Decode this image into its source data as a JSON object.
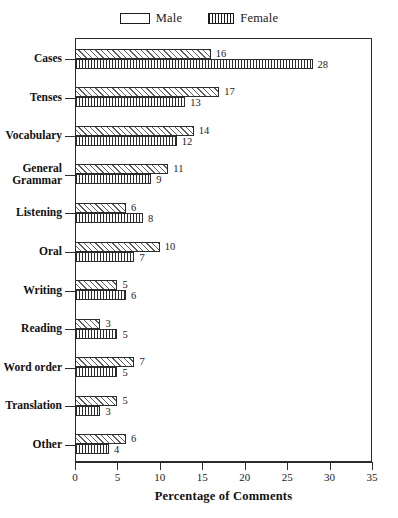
{
  "chart_data": {
    "type": "bar",
    "orientation": "horizontal",
    "title": "",
    "xlabel": "Percentage of Comments",
    "ylabel": "",
    "xlim": [
      0,
      35
    ],
    "xticks": [
      0,
      5,
      10,
      15,
      20,
      25,
      30,
      35
    ],
    "grid": false,
    "legend_position": "top-center",
    "categories": [
      "Cases",
      "Tenses",
      "Vocabulary",
      "General\nGrammar",
      "Listening",
      "Oral",
      "Writing",
      "Reading",
      "Word order",
      "Translation",
      "Other"
    ],
    "series": [
      {
        "name": "Male",
        "pattern": "diagonal-hatch",
        "values": [
          16,
          17,
          14,
          11,
          6,
          10,
          5,
          3,
          7,
          5,
          6
        ]
      },
      {
        "name": "Female",
        "pattern": "vertical-hatch",
        "values": [
          28,
          13,
          12,
          9,
          8,
          7,
          6,
          5,
          5,
          3,
          4
        ]
      }
    ]
  },
  "legend": {
    "entries": [
      {
        "label": "Male",
        "swatch": "legend-swatch-male"
      },
      {
        "label": "Female",
        "swatch": "legend-swatch-female"
      }
    ]
  },
  "colors": {
    "axis": "#2b2b2b",
    "text": "#1a1a1a",
    "background": "#ffffff",
    "hatch": "#5e5e5e"
  }
}
